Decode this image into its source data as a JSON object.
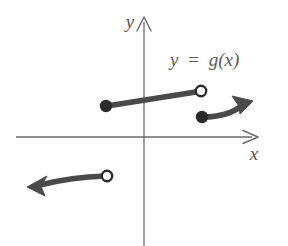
{
  "figure": {
    "title": "",
    "background_color": "#ffffff",
    "axis_color": "#6b6b6b",
    "curve_color": "#4a4a4a",
    "label_color": "#555555",
    "axes": {
      "y_axis_label": "y",
      "x_axis_label": "x",
      "origin": {
        "x": 144,
        "y": 137
      },
      "x_axis": {
        "start_x": 16,
        "end_x": 258,
        "y": 137,
        "arrow": "right"
      },
      "y_axis": {
        "x": 144,
        "top_y": 18,
        "bottom_y": 246,
        "arrow": "up"
      }
    },
    "function_label": {
      "text": "y = g(x)",
      "lhs": "y",
      "operator": "=",
      "rhs": "g(x)",
      "x": 170,
      "y": 65
    },
    "branches": [
      {
        "name": "middle-segment",
        "kind": "line-segment",
        "start": {
          "x": 106,
          "y": 106,
          "endpoint": "closed"
        },
        "end": {
          "x": 200,
          "y": 91,
          "endpoint": "open"
        }
      },
      {
        "name": "right-branch",
        "kind": "curve-with-arrow",
        "start": {
          "x": 202,
          "y": 117,
          "endpoint": "closed"
        },
        "control": {
          "x": 228,
          "y": 116
        },
        "end": {
          "x": 250,
          "y": 103,
          "endpoint": "arrow"
        },
        "arrow_direction": "up-right"
      },
      {
        "name": "lower-left-branch",
        "kind": "curve-with-arrow",
        "start": {
          "x": 107,
          "y": 176,
          "endpoint": "open"
        },
        "control": {
          "x": 72,
          "y": 177
        },
        "end": {
          "x": 30,
          "y": 186,
          "endpoint": "arrow"
        },
        "arrow_direction": "left-down"
      }
    ],
    "endpoint_markers": [
      {
        "name": "closed-dot-left",
        "x": 106,
        "y": 106,
        "type": "filled",
        "radius": 6
      },
      {
        "name": "open-circle-upper-right",
        "x": 201,
        "y": 91,
        "type": "open",
        "radius": 6
      },
      {
        "name": "closed-dot-right",
        "x": 202,
        "y": 117,
        "type": "filled",
        "radius": 6
      },
      {
        "name": "open-circle-lower-left",
        "x": 107,
        "y": 176,
        "type": "open",
        "radius": 6
      }
    ]
  }
}
